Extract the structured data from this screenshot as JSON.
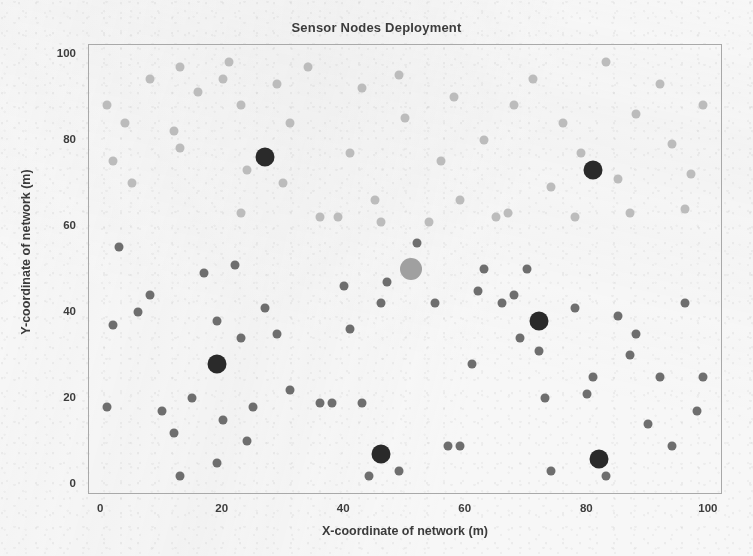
{
  "chart_data": {
    "type": "scatter",
    "title": "Sensor Nodes Deployment",
    "xlabel": "X-coordinate of network (m)",
    "ylabel": "Y-coordinate of network (m)",
    "xlim": [
      -2,
      102
    ],
    "ylim": [
      -2,
      102
    ],
    "xticks": [
      0,
      20,
      40,
      60,
      80,
      100
    ],
    "yticks": [
      0,
      20,
      40,
      60,
      80,
      100
    ],
    "grid": false,
    "legend": "none",
    "colors": {
      "background": "#f7f7f7",
      "axis": "#a9a9a9",
      "text": "#3b3b3b",
      "upper_member_node": "#bcbcbc",
      "lower_member_node": "#6e6e6e",
      "cluster_head": "#2a2a2a",
      "base_station": "#a0a0a0"
    },
    "marker_sizes": {
      "member_node": 9,
      "cluster_head": 19,
      "base_station": 22
    },
    "series": [
      {
        "name": "Upper-region member nodes",
        "color": "#bcbcbc",
        "size": 9,
        "points": [
          [
            1,
            88
          ],
          [
            4,
            84
          ],
          [
            8,
            94
          ],
          [
            2,
            75
          ],
          [
            5,
            70
          ],
          [
            13,
            97
          ],
          [
            16,
            91
          ],
          [
            12,
            82
          ],
          [
            13,
            78
          ],
          [
            21,
            98
          ],
          [
            20,
            94
          ],
          [
            23,
            88
          ],
          [
            24,
            73
          ],
          [
            23,
            63
          ],
          [
            29,
            93
          ],
          [
            31,
            84
          ],
          [
            34,
            97
          ],
          [
            30,
            70
          ],
          [
            36,
            62
          ],
          [
            39,
            62
          ],
          [
            41,
            77
          ],
          [
            43,
            92
          ],
          [
            45,
            66
          ],
          [
            46,
            61
          ],
          [
            49,
            95
          ],
          [
            50,
            85
          ],
          [
            54,
            61
          ],
          [
            56,
            75
          ],
          [
            58,
            90
          ],
          [
            59,
            66
          ],
          [
            63,
            80
          ],
          [
            65,
            62
          ],
          [
            67,
            63
          ],
          [
            68,
            88
          ],
          [
            71,
            94
          ],
          [
            74,
            69
          ],
          [
            76,
            84
          ],
          [
            78,
            62
          ],
          [
            79,
            77
          ],
          [
            83,
            98
          ],
          [
            85,
            71
          ],
          [
            87,
            63
          ],
          [
            88,
            86
          ],
          [
            92,
            93
          ],
          [
            94,
            79
          ],
          [
            96,
            64
          ],
          [
            99,
            88
          ],
          [
            97,
            72
          ]
        ]
      },
      {
        "name": "Lower-region member nodes",
        "color": "#6e6e6e",
        "size": 9,
        "points": [
          [
            2,
            37
          ],
          [
            3,
            55
          ],
          [
            1,
            18
          ],
          [
            6,
            40
          ],
          [
            8,
            44
          ],
          [
            10,
            17
          ],
          [
            12,
            12
          ],
          [
            13,
            2
          ],
          [
            15,
            20
          ],
          [
            17,
            49
          ],
          [
            19,
            38
          ],
          [
            20,
            15
          ],
          [
            19,
            5
          ],
          [
            22,
            51
          ],
          [
            23,
            34
          ],
          [
            25,
            18
          ],
          [
            24,
            10
          ],
          [
            27,
            41
          ],
          [
            29,
            35
          ],
          [
            31,
            22
          ],
          [
            36,
            19
          ],
          [
            38,
            19
          ],
          [
            40,
            46
          ],
          [
            41,
            36
          ],
          [
            43,
            19
          ],
          [
            44,
            2
          ],
          [
            46,
            42
          ],
          [
            47,
            47
          ],
          [
            49,
            3
          ],
          [
            52,
            56
          ],
          [
            55,
            42
          ],
          [
            57,
            9
          ],
          [
            59,
            9
          ],
          [
            61,
            28
          ],
          [
            62,
            45
          ],
          [
            63,
            50
          ],
          [
            66,
            42
          ],
          [
            68,
            44
          ],
          [
            69,
            34
          ],
          [
            70,
            50
          ],
          [
            72,
            31
          ],
          [
            73,
            20
          ],
          [
            74,
            3
          ],
          [
            78,
            41
          ],
          [
            80,
            21
          ],
          [
            81,
            25
          ],
          [
            83,
            2
          ],
          [
            85,
            39
          ],
          [
            87,
            30
          ],
          [
            88,
            35
          ],
          [
            90,
            14
          ],
          [
            92,
            25
          ],
          [
            94,
            9
          ],
          [
            96,
            42
          ],
          [
            98,
            17
          ],
          [
            99,
            25
          ]
        ]
      },
      {
        "name": "Cluster heads",
        "color": "#2a2a2a",
        "size": 19,
        "points": [
          [
            27,
            76
          ],
          [
            81,
            73
          ],
          [
            19,
            28
          ],
          [
            72,
            38
          ],
          [
            46,
            7
          ],
          [
            82,
            6
          ]
        ]
      },
      {
        "name": "Base station",
        "color": "#a0a0a0",
        "size": 22,
        "points": [
          [
            51,
            50
          ]
        ]
      }
    ]
  }
}
